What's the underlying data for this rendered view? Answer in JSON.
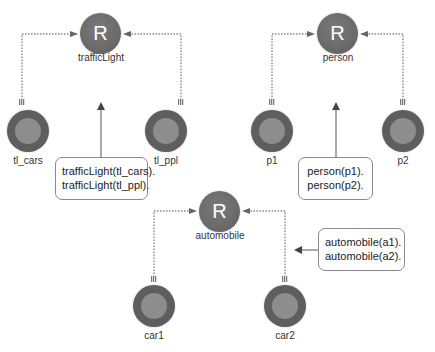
{
  "diagram": {
    "type": "entity-relationship",
    "relations": [
      {
        "name": "trafficLight",
        "symbol": "R",
        "instances": [
          "tl_cars",
          "tl_ppl"
        ],
        "facts": [
          "trafficLight(tl_cars).",
          "trafficLight(tl_ppl)."
        ]
      },
      {
        "name": "person",
        "symbol": "R",
        "instances": [
          "p1",
          "p2"
        ],
        "facts": [
          "person(p1).",
          "person(p2)."
        ]
      },
      {
        "name": "automobile",
        "symbol": "R",
        "instances": [
          "car1",
          "car2"
        ],
        "facts": [
          "automobile(a1).",
          "automobile(a2)."
        ]
      }
    ]
  },
  "colors": {
    "relation_node": "#6a6a6a",
    "instance_outer": "#5e5e5e",
    "instance_core": "#8d8d8d",
    "edge": "#888888",
    "callout_border": "#8a8a8a",
    "text": "#333333"
  }
}
